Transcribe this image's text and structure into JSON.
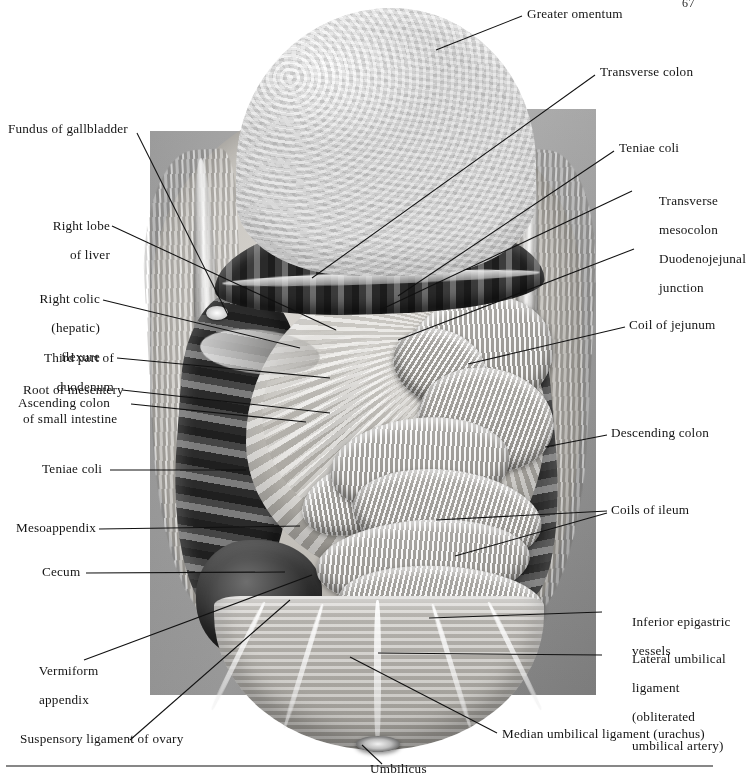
{
  "page": {
    "folio": "67",
    "figure_kind": "anatomical-illustration",
    "palette": {
      "ink": "#141414",
      "rule": "#4a4a4a",
      "backdrop_gray": "#9d9d9d",
      "paper": "#ffffff"
    }
  },
  "labels_left": [
    {
      "id": "fundus-of-gallbladder",
      "text": "Fundus of gallbladder"
    },
    {
      "id": "right-lobe-of-liver",
      "line1": "Right lobe",
      "line2": "of liver"
    },
    {
      "id": "right-colic-hepatic-flexure",
      "line1": "Right colic",
      "line2": "(hepatic)",
      "line3": "flexure"
    },
    {
      "id": "third-part-of-duodenum",
      "line1": "Third part of",
      "line2": "duodenum"
    },
    {
      "id": "root-of-mesentery-of-small-intestine",
      "line1": "Root of mesentery",
      "line2": "of small intestine"
    },
    {
      "id": "ascending-colon",
      "text": "Ascending colon"
    },
    {
      "id": "teniae-coli-left",
      "text": "Teniae coli"
    },
    {
      "id": "mesoappendix",
      "text": "Mesoappendix"
    },
    {
      "id": "cecum",
      "text": "Cecum"
    },
    {
      "id": "vermiform-appendix",
      "line1": "Vermiform",
      "line2": "appendix"
    },
    {
      "id": "suspensory-ligament-of-ovary",
      "text": "Suspensory ligament of ovary"
    }
  ],
  "labels_right": [
    {
      "id": "greater-omentum",
      "text": "Greater omentum"
    },
    {
      "id": "transverse-colon",
      "text": "Transverse colon"
    },
    {
      "id": "teniae-coli-right",
      "text": "Teniae coli"
    },
    {
      "id": "transverse-mesocolon",
      "line1": "Transverse",
      "line2": "mesocolon"
    },
    {
      "id": "duodenojejunal-junction",
      "line1": "Duodenojejunal",
      "line2": "junction"
    },
    {
      "id": "coil-of-jejunum",
      "text": "Coil of jejunum"
    },
    {
      "id": "descending-colon",
      "text": "Descending colon"
    },
    {
      "id": "coils-of-ileum",
      "text": "Coils of ileum"
    },
    {
      "id": "inferior-epigastric-vessels",
      "line1": "Inferior epigastric",
      "line2": "vessels"
    },
    {
      "id": "lateral-umbilical-ligament",
      "line1": "Lateral umbilical",
      "line2": "ligament",
      "line3": "(obliterated",
      "line4": "umbilical artery)"
    }
  ],
  "labels_bottom": [
    {
      "id": "median-umbilical-ligament-urachus",
      "text": "Median umbilical ligament (urachus)"
    },
    {
      "id": "umbilicus",
      "text": "Umbilicus"
    }
  ]
}
